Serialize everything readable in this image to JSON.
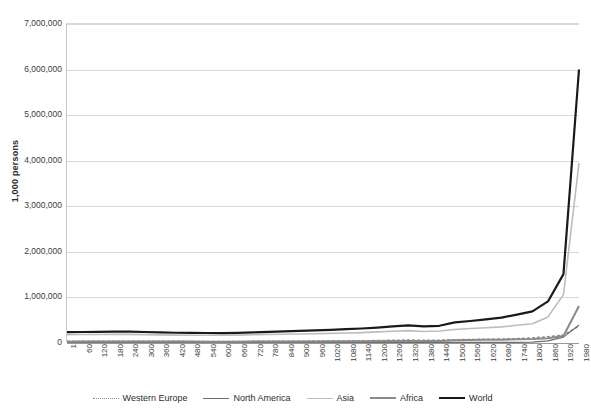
{
  "chart": {
    "type": "line",
    "y_axis_title": "1,000 persons",
    "x_axis_title": ""
  },
  "y_ticks": [
    {
      "label": "7,000,000",
      "value": 7000000
    },
    {
      "label": "6,000,000",
      "value": 6000000
    },
    {
      "label": "5,000,000",
      "value": 5000000
    },
    {
      "label": "4,000,000",
      "value": 4000000
    },
    {
      "label": "3,000,000",
      "value": 3000000
    },
    {
      "label": "2,000,000",
      "value": 2000000
    },
    {
      "label": "1,000,000",
      "value": 1000000
    },
    {
      "label": "0",
      "value": 0
    }
  ],
  "x_ticks": [
    "1",
    "60",
    "120",
    "180",
    "240",
    "300",
    "360",
    "420",
    "480",
    "540",
    "600",
    "660",
    "720",
    "780",
    "840",
    "900",
    "960",
    "1020",
    "1080",
    "1140",
    "1200",
    "1260",
    "1320",
    "1380",
    "1440",
    "1500",
    "1560",
    "1620",
    "1680",
    "1740",
    "1800",
    "1860",
    "1920",
    "1980"
  ],
  "legend": [
    {
      "label": "Western Europe",
      "color": "#8c8c8c",
      "style": "dotted",
      "width": 1.6
    },
    {
      "label": "North America",
      "color": "#6e6e6e",
      "style": "solid",
      "width": 1.2
    },
    {
      "label": "Asia",
      "color": "#bdbdbd",
      "style": "solid",
      "width": 1.6
    },
    {
      "label": "Africa",
      "color": "#8a8a8a",
      "style": "solid",
      "width": 2.0
    },
    {
      "label": "World",
      "color": "#1a1a1a",
      "style": "solid",
      "width": 2.2
    }
  ],
  "chart_data": {
    "type": "line",
    "title": "",
    "xlabel": "",
    "ylabel": "1,000 persons",
    "ylim": [
      0,
      7000000
    ],
    "xlim": [
      1,
      1980
    ],
    "grid": true,
    "legend_position": "bottom",
    "x": [
      1,
      60,
      120,
      180,
      240,
      300,
      360,
      420,
      480,
      540,
      600,
      660,
      720,
      780,
      840,
      900,
      960,
      1020,
      1080,
      1140,
      1200,
      1260,
      1320,
      1380,
      1440,
      1500,
      1560,
      1620,
      1680,
      1740,
      1800,
      1860,
      1920,
      1980
    ],
    "categories": [
      "1",
      "60",
      "120",
      "180",
      "240",
      "300",
      "360",
      "420",
      "480",
      "540",
      "600",
      "660",
      "720",
      "780",
      "840",
      "900",
      "960",
      "1020",
      "1080",
      "1140",
      "1200",
      "1260",
      "1320",
      "1380",
      "1440",
      "1500",
      "1560",
      "1620",
      "1680",
      "1740",
      "1800",
      "1860",
      "1920",
      "1980"
    ],
    "series": [
      {
        "name": "Western Europe",
        "color": "#8c8c8c",
        "style": "dotted",
        "values": [
          24700,
          25000,
          25500,
          25800,
          25000,
          24000,
          22500,
          21500,
          20500,
          20000,
          19500,
          20000,
          21000,
          22500,
          24000,
          25500,
          27000,
          29000,
          31500,
          34500,
          40000,
          45000,
          50000,
          44000,
          47000,
          57300,
          62000,
          68000,
          73500,
          81500,
          95000,
          125000,
          160000,
          360000
        ]
      },
      {
        "name": "North America",
        "color": "#6e6e6e",
        "style": "solid",
        "values": [
          680,
          700,
          720,
          740,
          760,
          780,
          800,
          820,
          840,
          860,
          880,
          900,
          920,
          950,
          980,
          1000,
          1050,
          1100,
          1150,
          1200,
          1300,
          1400,
          1500,
          1600,
          1750,
          1800,
          1800,
          1750,
          1250,
          1500,
          5700,
          33000,
          115000,
          380000
        ]
      },
      {
        "name": "Asia",
        "color": "#bdbdbd",
        "style": "solid",
        "values": [
          171200,
          172000,
          174000,
          176000,
          175000,
          170000,
          165000,
          160000,
          158000,
          157000,
          156000,
          160000,
          168000,
          175000,
          180000,
          185000,
          190000,
          198000,
          205000,
          215000,
          230000,
          245000,
          258000,
          240000,
          250000,
          283800,
          305000,
          320000,
          340000,
          375000,
          411000,
          560000,
          1050000,
          3940000
        ]
      },
      {
        "name": "Africa",
        "color": "#8a8a8a",
        "style": "solid",
        "values": [
          16500,
          17000,
          17500,
          18000,
          18200,
          18000,
          17500,
          17000,
          16800,
          16500,
          16200,
          16500,
          17000,
          18000,
          19000,
          20000,
          21000,
          22500,
          24000,
          26000,
          28000,
          30000,
          32000,
          30000,
          32000,
          46600,
          50000,
          55000,
          60000,
          70000,
          74200,
          90000,
          140000,
          800000
        ]
      },
      {
        "name": "World",
        "color": "#1a1a1a",
        "style": "solid",
        "values": [
          225800,
          228000,
          232000,
          236000,
          235000,
          228000,
          220000,
          212000,
          208000,
          206000,
          204000,
          210000,
          220000,
          232000,
          242000,
          252000,
          262000,
          275000,
          290000,
          305000,
          325000,
          350000,
          375000,
          350000,
          365000,
          438400,
          470000,
          505000,
          545000,
          610000,
          680000,
          900000,
          1500000,
          6000000
        ]
      }
    ]
  }
}
